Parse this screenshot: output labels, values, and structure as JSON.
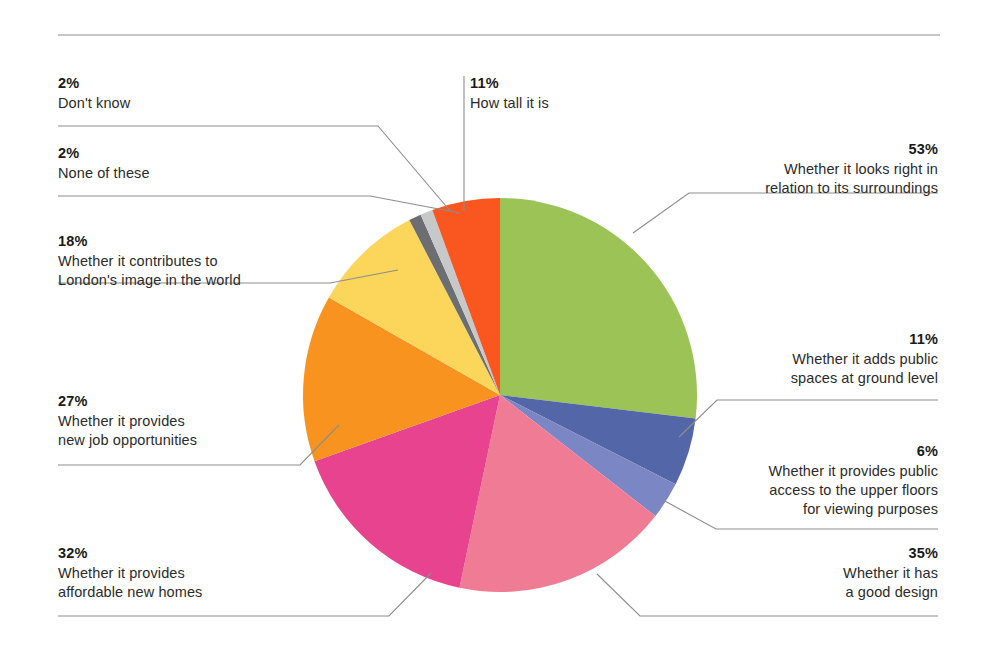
{
  "chart_data": {
    "type": "pie",
    "title": "",
    "total_percent": 197,
    "note": "Multi-select survey question; percentages sum to more than 100.",
    "legend_position": "callouts around pie",
    "slices": [
      {
        "label": "Whether it looks right in relation to its surroundings",
        "value": 53,
        "value_label": "53%",
        "color": "#9BC356"
      },
      {
        "label": "Whether it adds public spaces at ground level",
        "value": 11,
        "value_label": "11%",
        "color": "#5366A8"
      },
      {
        "label": "Whether it provides public access to the upper floors for viewing purposes",
        "value": 6,
        "value_label": "6%",
        "color": "#7B86C4"
      },
      {
        "label": "Whether it has a good design",
        "value": 35,
        "value_label": "35%",
        "color": "#F07B94"
      },
      {
        "label": "Whether it provides affordable new homes",
        "value": 32,
        "value_label": "32%",
        "color": "#E8438E"
      },
      {
        "label": "Whether it provides new job opportunities",
        "value": 27,
        "value_label": "27%",
        "color": "#F8931F"
      },
      {
        "label": "Whether it contributes to London's image in the world",
        "value": 18,
        "value_label": "18%",
        "color": "#FBD council"
      },
      {
        "label": "None of these",
        "value": 2,
        "value_label": "2%",
        "color": "#6D6E71"
      },
      {
        "label": "Don't know",
        "value": 2,
        "value_label": "2%",
        "color": "#C7C8CA"
      },
      {
        "label": "How tall it is",
        "value": 11,
        "value_label": "11%",
        "color": "#F9571F"
      }
    ]
  },
  "callouts": {
    "dont_know": {
      "pct": "2%",
      "lines": [
        "Don't know"
      ]
    },
    "none": {
      "pct": "2%",
      "lines": [
        "None of these"
      ]
    },
    "london": {
      "pct": "18%",
      "lines": [
        "Whether it contributes to",
        "London's image in the world"
      ]
    },
    "jobs": {
      "pct": "27%",
      "lines": [
        "Whether it provides",
        "new job opportunities"
      ]
    },
    "homes": {
      "pct": "32%",
      "lines": [
        "Whether it provides",
        "affordable new homes"
      ]
    },
    "tall": {
      "pct": "11%",
      "lines": [
        "How tall it is"
      ]
    },
    "surround": {
      "pct": "53%",
      "lines": [
        "Whether it looks right in",
        "relation to its surroundings"
      ]
    },
    "ground": {
      "pct": "11%",
      "lines": [
        "Whether it adds public",
        "spaces at ground level"
      ]
    },
    "access": {
      "pct": "6%",
      "lines": [
        "Whether it provides public",
        "access to the upper floors",
        "for viewing purposes"
      ]
    },
    "design": {
      "pct": "35%",
      "lines": [
        "Whether it has",
        "a good design"
      ]
    }
  },
  "colors": {
    "rule": "#8d8d8d",
    "leader": "#8d8d8d",
    "text": "#231f20",
    "background": "#ffffff"
  }
}
